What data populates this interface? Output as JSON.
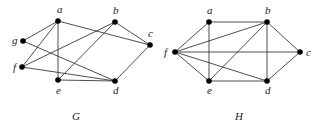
{
  "graphs": [
    {
      "id": "G",
      "caption": "G",
      "caption_pos": [
        72,
        120
      ],
      "nodes": [
        {
          "id": "a",
          "label": "a",
          "x": 58,
          "y": 21,
          "lx": 57,
          "ly": 13
        },
        {
          "id": "b",
          "label": "b",
          "x": 115,
          "y": 22,
          "lx": 113,
          "ly": 14
        },
        {
          "id": "c",
          "label": "c",
          "x": 150,
          "y": 45,
          "lx": 148,
          "ly": 37
        },
        {
          "id": "d",
          "label": "d",
          "x": 115,
          "y": 81,
          "lx": 113,
          "ly": 94
        },
        {
          "id": "e",
          "label": "e",
          "x": 58,
          "y": 80,
          "lx": 56,
          "ly": 94
        },
        {
          "id": "f",
          "label": "f",
          "x": 22,
          "y": 67,
          "lx": 13,
          "ly": 71
        },
        {
          "id": "g",
          "label": "g",
          "x": 23,
          "y": 41,
          "lx": 12,
          "ly": 44
        }
      ],
      "edges": [
        [
          "a",
          "g"
        ],
        [
          "a",
          "f"
        ],
        [
          "a",
          "e"
        ],
        [
          "a",
          "c"
        ],
        [
          "g",
          "d"
        ],
        [
          "f",
          "b"
        ],
        [
          "f",
          "d"
        ],
        [
          "e",
          "b"
        ],
        [
          "e",
          "d"
        ],
        [
          "b",
          "c"
        ],
        [
          "c",
          "d"
        ]
      ]
    },
    {
      "id": "H",
      "caption": "H",
      "caption_pos": [
        235,
        120
      ],
      "nodes": [
        {
          "id": "a",
          "label": "a",
          "x": 209,
          "y": 22,
          "lx": 207,
          "ly": 14
        },
        {
          "id": "b",
          "label": "b",
          "x": 267,
          "y": 22,
          "lx": 265,
          "ly": 14
        },
        {
          "id": "c",
          "label": "c",
          "x": 300,
          "y": 52,
          "lx": 306,
          "ly": 56
        },
        {
          "id": "d",
          "label": "d",
          "x": 267,
          "y": 81,
          "lx": 265,
          "ly": 94
        },
        {
          "id": "e",
          "label": "e",
          "x": 209,
          "y": 81,
          "lx": 207,
          "ly": 94
        },
        {
          "id": "f",
          "label": "f",
          "x": 175,
          "y": 52,
          "lx": 164,
          "ly": 56
        }
      ],
      "edges": [
        [
          "f",
          "a"
        ],
        [
          "f",
          "b"
        ],
        [
          "f",
          "c"
        ],
        [
          "f",
          "d"
        ],
        [
          "f",
          "e"
        ],
        [
          "a",
          "b"
        ],
        [
          "a",
          "e"
        ],
        [
          "b",
          "c"
        ],
        [
          "b",
          "d"
        ],
        [
          "b",
          "e"
        ],
        [
          "e",
          "d"
        ],
        [
          "d",
          "c"
        ]
      ]
    }
  ],
  "style": {
    "edge_color": "#3a3a3a",
    "node_color": "#000000",
    "label_color": "#222222",
    "node_radius": 2.8
  }
}
